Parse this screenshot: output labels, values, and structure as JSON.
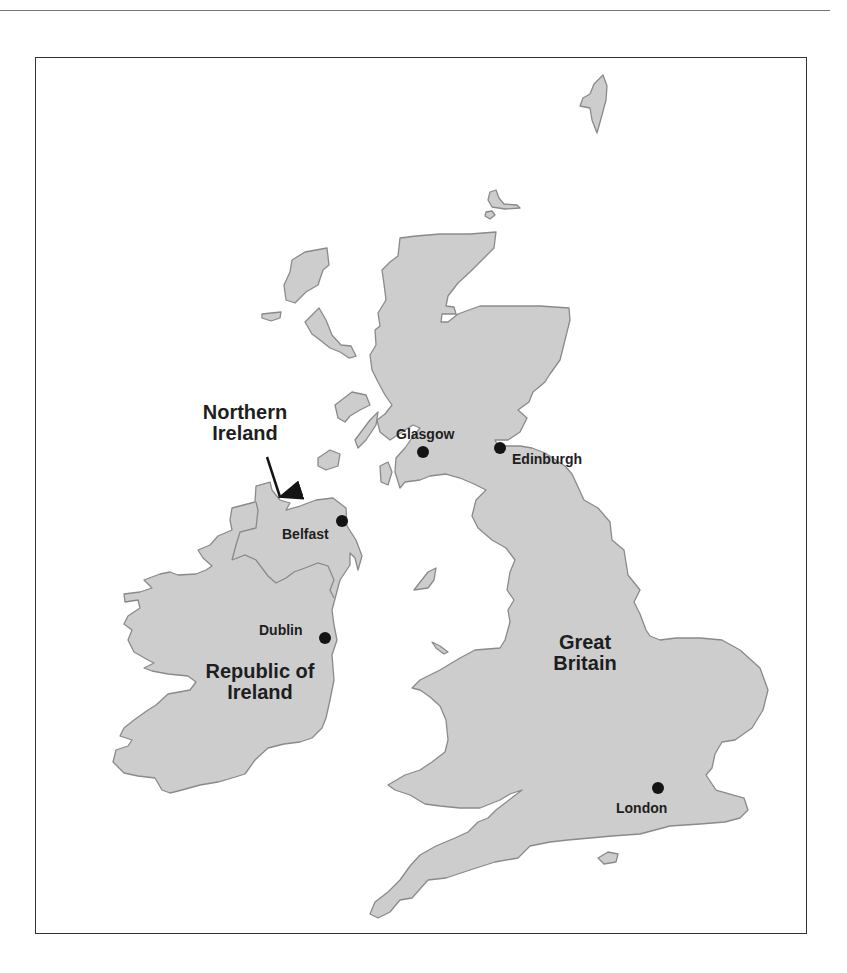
{
  "map": {
    "title": "British Isles",
    "colors": {
      "land": "#cdcdcd",
      "coastline": "#8a8a8a",
      "sea": "#ffffff",
      "frame": "#333333",
      "city_marker": "#141414",
      "label_text": "#1e1e1e"
    },
    "regions": [
      {
        "id": "northern-ireland",
        "label_line1": "Northern",
        "label_line2": "Ireland",
        "has_arrow": true
      },
      {
        "id": "republic-of-ireland",
        "label_line1": "Republic of",
        "label_line2": "Ireland"
      },
      {
        "id": "great-britain",
        "label_line1": "Great",
        "label_line2": "Britain"
      }
    ],
    "cities": [
      {
        "id": "glasgow",
        "name": "Glasgow"
      },
      {
        "id": "edinburgh",
        "name": "Edinburgh"
      },
      {
        "id": "belfast",
        "name": "Belfast"
      },
      {
        "id": "dublin",
        "name": "Dublin"
      },
      {
        "id": "london",
        "name": "London"
      }
    ]
  }
}
